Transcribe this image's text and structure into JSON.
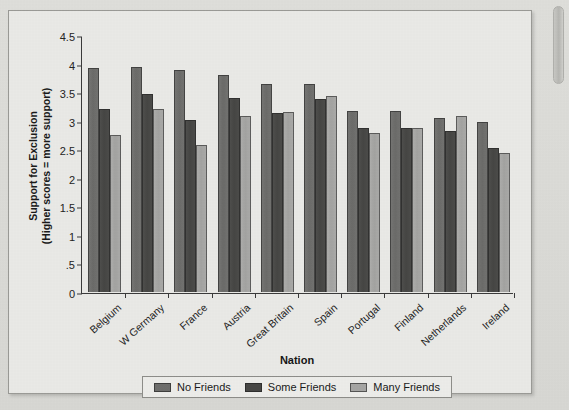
{
  "chart_data": {
    "type": "bar",
    "title": "",
    "xlabel": "Nation",
    "ylabel": "Support for Exclusion (Higher scores = more support)",
    "ylabel_lines": [
      "Support for Exclusion",
      "(Higher scores = more support)"
    ],
    "ylim": [
      0,
      4.5
    ],
    "grid": false,
    "legend_position": "bottom",
    "ytick_labels": [
      "0",
      ".5",
      "1",
      "1.5",
      "2",
      "2.5",
      "3",
      "3.5",
      "4",
      "4.5"
    ],
    "ytick_values": [
      0,
      0.5,
      1,
      1.5,
      2,
      2.5,
      3,
      3.5,
      4,
      4.5
    ],
    "categories": [
      "Belgium",
      "W Germany",
      "France",
      "Austria",
      "Great Britain",
      "Spain",
      "Portugal",
      "Finland",
      "Netherlands",
      "Ireland"
    ],
    "series": [
      {
        "name": "No Friends",
        "color": "#6e6e6c",
        "values": [
          3.93,
          3.94,
          3.88,
          3.8,
          3.64,
          3.65,
          3.17,
          3.17,
          3.05,
          2.98
        ]
      },
      {
        "name": "Some Friends",
        "color": "#474745",
        "values": [
          3.21,
          3.47,
          3.01,
          3.4,
          3.13,
          3.38,
          2.87,
          2.88,
          2.82,
          2.53
        ]
      },
      {
        "name": "Many Friends",
        "color": "#a6a6a4",
        "values": [
          2.75,
          3.21,
          2.58,
          3.09,
          3.16,
          3.44,
          2.79,
          2.88,
          3.08,
          2.43
        ]
      }
    ]
  },
  "legend": {
    "items": [
      {
        "label": "No Friends"
      },
      {
        "label": "Some Friends"
      },
      {
        "label": "Many Friends"
      }
    ]
  },
  "scrollbar": {
    "name": "vertical-scrollbar"
  }
}
